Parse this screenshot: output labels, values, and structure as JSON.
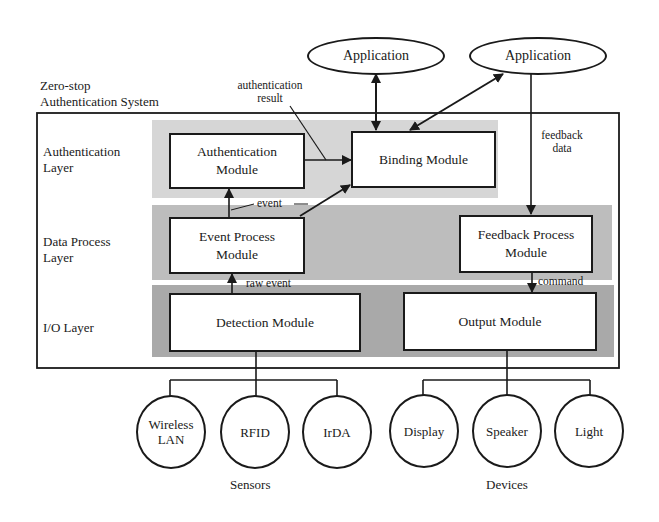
{
  "title": {
    "line1": "Zero-stop",
    "line2": "Authentication System"
  },
  "applications": [
    {
      "label": "Application"
    },
    {
      "label": "Application"
    }
  ],
  "layers": [
    {
      "line1": "Authentication",
      "line2": "Layer"
    },
    {
      "line1": "Data Process",
      "line2": "Layer"
    },
    {
      "line1": "I/O Layer",
      "line2": ""
    }
  ],
  "modules": {
    "authentication": {
      "line1": "Authentication",
      "line2": "Module"
    },
    "binding": {
      "line1": "Binding Module"
    },
    "event_process": {
      "line1": "Event Process",
      "line2": "Module"
    },
    "feedback_process": {
      "line1": "Feedback Process",
      "line2": "Module"
    },
    "detection": {
      "line1": "Detection Module"
    },
    "output": {
      "line1": "Output Module"
    }
  },
  "edge_labels": {
    "authentication_result": {
      "line1": "authentication",
      "line2": "result"
    },
    "feedback_data": {
      "line1": "feedback",
      "line2": "data"
    },
    "event": "event",
    "raw_event": "raw event",
    "command": "command"
  },
  "sensors": {
    "group_label": "Sensors",
    "items": [
      {
        "line1": "Wireless",
        "line2": "LAN"
      },
      {
        "line1": "RFID",
        "line2": ""
      },
      {
        "line1": "IrDA",
        "line2": ""
      }
    ]
  },
  "devices": {
    "group_label": "Devices",
    "items": [
      {
        "line1": "Display",
        "line2": ""
      },
      {
        "line1": "Speaker",
        "line2": ""
      },
      {
        "line1": "Light",
        "line2": ""
      }
    ]
  },
  "colors": {
    "line": "#1a1a1a",
    "auth_layer_fill": "#d6d6d6",
    "data_layer_fill": "#bdbdbd",
    "io_layer_fill": "#a9a9a9",
    "box_fill": "#ffffff"
  }
}
